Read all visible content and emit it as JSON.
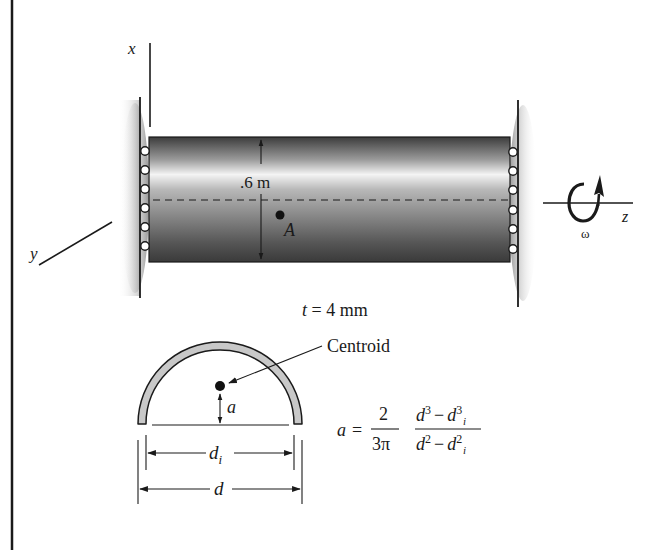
{
  "figure": {
    "type": "engineering mechanics diagram",
    "axes": {
      "x_label": "x",
      "y_label": "y",
      "z_label": "z"
    },
    "cylinder": {
      "diameter_label": ".6 m",
      "point_label": "A",
      "thickness_label": "t = 4 mm",
      "rotation_label": "ω",
      "supports": "roller bearings on both ends (6 rollers each)"
    },
    "cross_section": {
      "shape": "semicircular thin-walled section",
      "centroid_label": "Centroid",
      "a_label": "a",
      "inner_diameter_label": "d",
      "inner_diameter_subscript": "i",
      "outer_diameter_label": "d"
    },
    "formula": {
      "lhs": "a",
      "equals": "=",
      "coef_numerator": "2",
      "coef_denominator": "3π",
      "num_d": "d",
      "num_d_exp": "3",
      "num_minus": "−",
      "num_di": "d",
      "num_di_sub": "i",
      "num_di_exp": "3",
      "den_d": "d",
      "den_d_exp": "2",
      "den_minus": "−",
      "den_di": "d",
      "den_di_sub": "i",
      "den_di_exp": "2"
    },
    "colors": {
      "line": "#1a1a1a",
      "cylinder_dark": "#3a3a3a",
      "cylinder_light": "#f2f2f2",
      "section_fill": "#c8c8c8",
      "wall_shadow": "#9a9a9a"
    }
  }
}
